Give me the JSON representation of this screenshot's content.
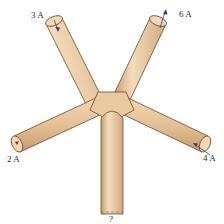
{
  "diagram": {
    "wires": [
      {
        "id": "upper-left",
        "current_label": "3 A",
        "direction": "into junction"
      },
      {
        "id": "upper-right",
        "current_label": "6 A",
        "direction": "out of junction"
      },
      {
        "id": "left",
        "current_label": "2 A",
        "direction": "out of junction"
      },
      {
        "id": "right",
        "current_label": "4 A",
        "direction": "into junction"
      },
      {
        "id": "bottom",
        "current_label": "?",
        "direction": "unknown"
      }
    ],
    "colors": {
      "wire_fill": "#e8c9a0",
      "wire_shadow": "#c9a177",
      "wire_highlight": "#f5e2c6",
      "outline": "#6b4a2e",
      "arrow": "#3a3a7a"
    }
  }
}
